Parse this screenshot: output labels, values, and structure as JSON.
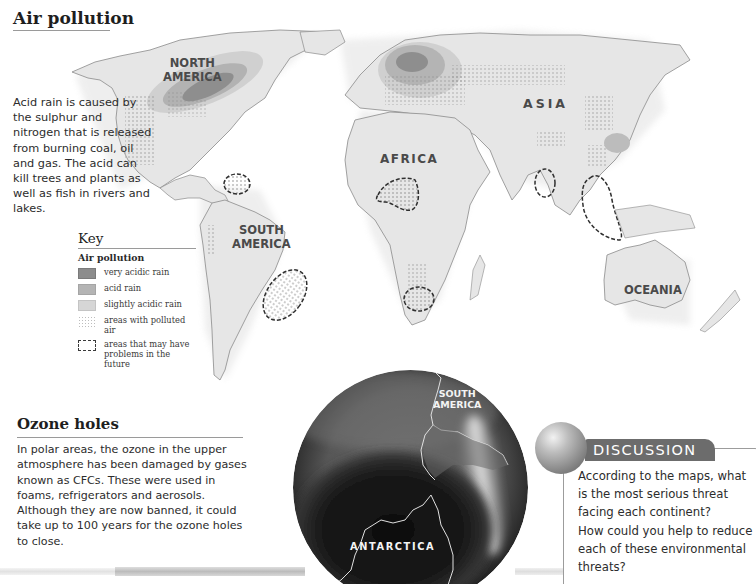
{
  "air_pollution": {
    "title": "Air pollution",
    "description": "Acid rain is caused by the sulphur and nitrogen that is released from burning coal, oil and gas. The acid can kill trees and plants as well as fish in rivers and lakes.",
    "map": {
      "continent_labels": {
        "north_america": [
          "NORTH",
          "AMERICA"
        ],
        "south_america": [
          "SOUTH",
          "AMERICA"
        ],
        "africa": "AFRICA",
        "asia": "ASIA",
        "oceania": "OCEANIA"
      }
    },
    "key": {
      "title": "Key",
      "subtitle": "Air pollution",
      "items": [
        {
          "label": "very acidic rain",
          "swatch": "very-acidic",
          "color": "#8c8c8c"
        },
        {
          "label": "acid rain",
          "swatch": "acid",
          "color": "#b4b4b4"
        },
        {
          "label": "slightly acidic rain",
          "swatch": "slightly-acidic",
          "color": "#d6d6d6"
        },
        {
          "label": "areas with polluted air",
          "swatch": "dotted"
        },
        {
          "label": "areas that may have problems in the future",
          "swatch": "dashed-outline"
        }
      ]
    }
  },
  "ozone": {
    "title": "Ozone holes",
    "description": "In polar areas, the ozone in the upper atmosphere has been damaged by gases known as CFCs. These were used in foams, refrigerators and aerosols. Although they are now banned, it could take up to 100 years for the ozone holes to close.",
    "globe_labels": {
      "south_america": [
        "SOUTH",
        "AMERICA"
      ],
      "antarctica": "ANTARCTICA"
    }
  },
  "discussion": {
    "title": "DISCUSSION",
    "questions": [
      "According to the maps, what is the most serious threat facing each continent?",
      "How could you help to reduce each of these environmental threats?"
    ]
  }
}
